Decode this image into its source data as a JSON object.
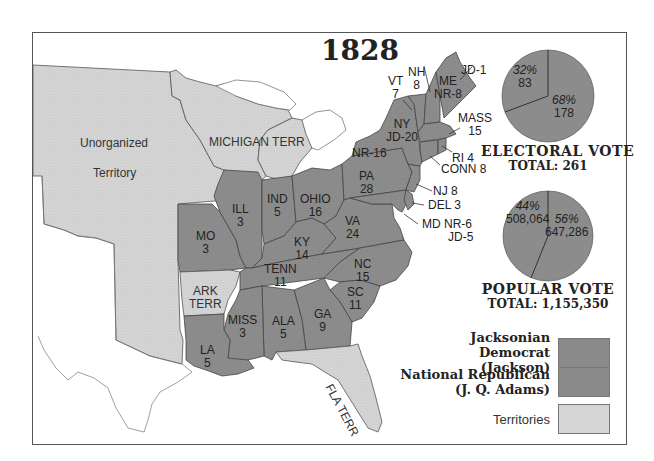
{
  "title": "1828",
  "colors": {
    "jacksonian_democrat": "#8a8a8a",
    "national_republican": "#8a8a8a",
    "territories": "#d6d6d6",
    "water": "#ffffff",
    "border": "#444444",
    "frame": "#555555"
  },
  "territories": [
    {
      "name": "Unorganized",
      "line2": "Territory"
    },
    {
      "name": "MICHIGAN TERR"
    },
    {
      "name": "ARK",
      "line2": "TERR"
    },
    {
      "name": "FLA TERR"
    }
  ],
  "states": [
    {
      "abbr": "ME",
      "votes": "NR-8",
      "split_extra": "JD-1",
      "party": "split"
    },
    {
      "abbr": "NH",
      "votes": "8",
      "party": "national_republican"
    },
    {
      "abbr": "VT",
      "votes": "7",
      "party": "national_republican"
    },
    {
      "abbr": "MASS",
      "votes": "15",
      "party": "national_republican"
    },
    {
      "abbr": "RI",
      "votes": "4",
      "party": "national_republican"
    },
    {
      "abbr": "CONN",
      "votes": "8",
      "party": "national_republican"
    },
    {
      "abbr": "NY",
      "votes": "JD-20",
      "split_extra": "NR-16",
      "party": "split"
    },
    {
      "abbr": "NJ",
      "votes": "8",
      "party": "national_republican"
    },
    {
      "abbr": "DEL",
      "votes": "3",
      "party": "national_republican"
    },
    {
      "abbr": "MD",
      "votes": "NR-6",
      "split_extra": "JD-5",
      "party": "split"
    },
    {
      "abbr": "PA",
      "votes": "28",
      "party": "jacksonian_democrat"
    },
    {
      "abbr": "VA",
      "votes": "24",
      "party": "jacksonian_democrat"
    },
    {
      "abbr": "OHIO",
      "votes": "16",
      "party": "jacksonian_democrat"
    },
    {
      "abbr": "IND",
      "votes": "5",
      "party": "jacksonian_democrat"
    },
    {
      "abbr": "ILL",
      "votes": "3",
      "party": "jacksonian_democrat"
    },
    {
      "abbr": "MO",
      "votes": "3",
      "party": "jacksonian_democrat"
    },
    {
      "abbr": "KY",
      "votes": "14",
      "party": "jacksonian_democrat"
    },
    {
      "abbr": "TENN",
      "votes": "11",
      "party": "jacksonian_democrat"
    },
    {
      "abbr": "NC",
      "votes": "15",
      "party": "jacksonian_democrat"
    },
    {
      "abbr": "SC",
      "votes": "11",
      "party": "jacksonian_democrat"
    },
    {
      "abbr": "GA",
      "votes": "9",
      "party": "jacksonian_democrat"
    },
    {
      "abbr": "ALA",
      "votes": "5",
      "party": "jacksonian_democrat"
    },
    {
      "abbr": "MISS",
      "votes": "3",
      "party": "jacksonian_democrat"
    },
    {
      "abbr": "LA",
      "votes": "5",
      "party": "jacksonian_democrat"
    }
  ],
  "electoral_vote": {
    "caption": "ELECTORAL VOTE",
    "total_label": "TOTAL: 261",
    "slices": [
      {
        "party": "National Republican",
        "pct": "32%",
        "value": "83"
      },
      {
        "party": "Jacksonian Democrat",
        "pct": "68%",
        "value": "178"
      }
    ]
  },
  "popular_vote": {
    "caption": "POPULAR VOTE",
    "total_label": "TOTAL: 1,155,350",
    "slices": [
      {
        "party": "National Republican",
        "pct": "44%",
        "value": "508,064"
      },
      {
        "party": "Jacksonian Democrat",
        "pct": "56%",
        "value": "647,286"
      }
    ]
  },
  "legend": [
    {
      "label_line1": "Jacksonian Democrat",
      "label_line2": "(Jackson)",
      "key": "jacksonian_democrat"
    },
    {
      "label_line1": "National Republican",
      "label_line2": "(J. Q. Adams)",
      "key": "national_republican"
    },
    {
      "label_line1": "Territories",
      "label_line2": "",
      "key": "territories"
    }
  ]
}
